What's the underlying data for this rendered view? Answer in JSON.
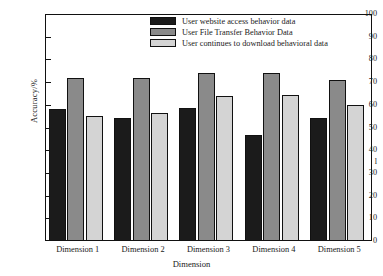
{
  "chart_data": {
    "type": "bar",
    "title": "",
    "xlabel": "Dimension",
    "ylabel": "Accuracy/%",
    "ylim": [
      0,
      100
    ],
    "ytick_labels": [
      "100",
      "90",
      "80",
      "70",
      "60",
      "50",
      "40",
      "30",
      "20",
      "10",
      "0"
    ],
    "ytick_values": [
      100,
      90,
      80,
      70,
      60,
      50,
      40,
      30,
      20,
      10,
      0
    ],
    "stray_tick_label": "l",
    "grid": false,
    "legend_position": "top-center",
    "categories": [
      "Dimension 1",
      "Dimension 2",
      "Dimension 3",
      "Dimension 4",
      "Dimension 5"
    ],
    "series": [
      {
        "name": "User website access behavior data",
        "color": "#1b1b1b",
        "values": [
          58,
          54,
          58.5,
          46.5,
          54
        ]
      },
      {
        "name": "User File Transfer Behavior Data",
        "color": "#8a8a8a",
        "values": [
          72,
          72,
          74,
          74,
          71
        ]
      },
      {
        "name": "User continues to download behavioral data",
        "color": "#d4d4d4",
        "values": [
          55,
          56.5,
          64,
          64.5,
          60
        ]
      }
    ]
  },
  "colors": {
    "axis": "#111111",
    "background": "#ffffff",
    "series_1": "#1b1b1b",
    "series_2": "#8a8a8a",
    "series_3": "#d4d4d4"
  }
}
